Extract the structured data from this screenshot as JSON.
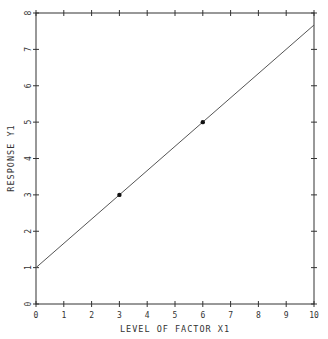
{
  "chart_data": {
    "type": "line",
    "title": "",
    "xlabel": "LEVEL OF FACTOR X1",
    "ylabel": "RESPONSE Y1",
    "xlim": [
      0,
      10
    ],
    "ylim": [
      0,
      8
    ],
    "x_ticks": [
      "0",
      "1",
      "2",
      "3",
      "4",
      "5",
      "6",
      "7",
      "8",
      "9",
      "10"
    ],
    "y_ticks": [
      "0",
      "1",
      "2",
      "3",
      "4",
      "5",
      "6",
      "7",
      "8"
    ],
    "grid": false,
    "legend": null,
    "series": [
      {
        "name": "fitted line",
        "kind": "line",
        "x": [
          0,
          10
        ],
        "y": [
          1,
          7.67
        ]
      },
      {
        "name": "observations",
        "kind": "scatter",
        "x": [
          3,
          6
        ],
        "y": [
          3,
          5
        ]
      }
    ],
    "colors": {
      "axis": "#333333",
      "line": "#555555",
      "points": "#111111"
    }
  }
}
